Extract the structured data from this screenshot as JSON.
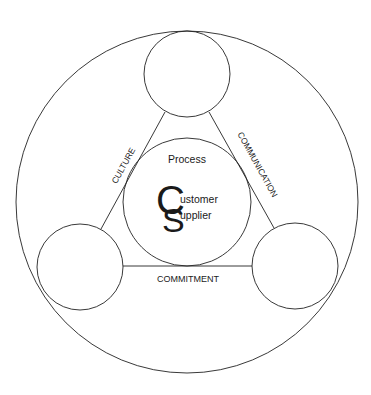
{
  "diagram": {
    "center_label": "Process",
    "logo": {
      "big_c": "C",
      "big_s": "S",
      "line1": "ustomer",
      "line2": "upplier"
    },
    "edges": {
      "left": "CULTURE",
      "right": "COMMUNICATION",
      "bottom": "COMMITMENT"
    },
    "colors": {
      "stroke": "#222222",
      "background": "#ffffff"
    }
  }
}
